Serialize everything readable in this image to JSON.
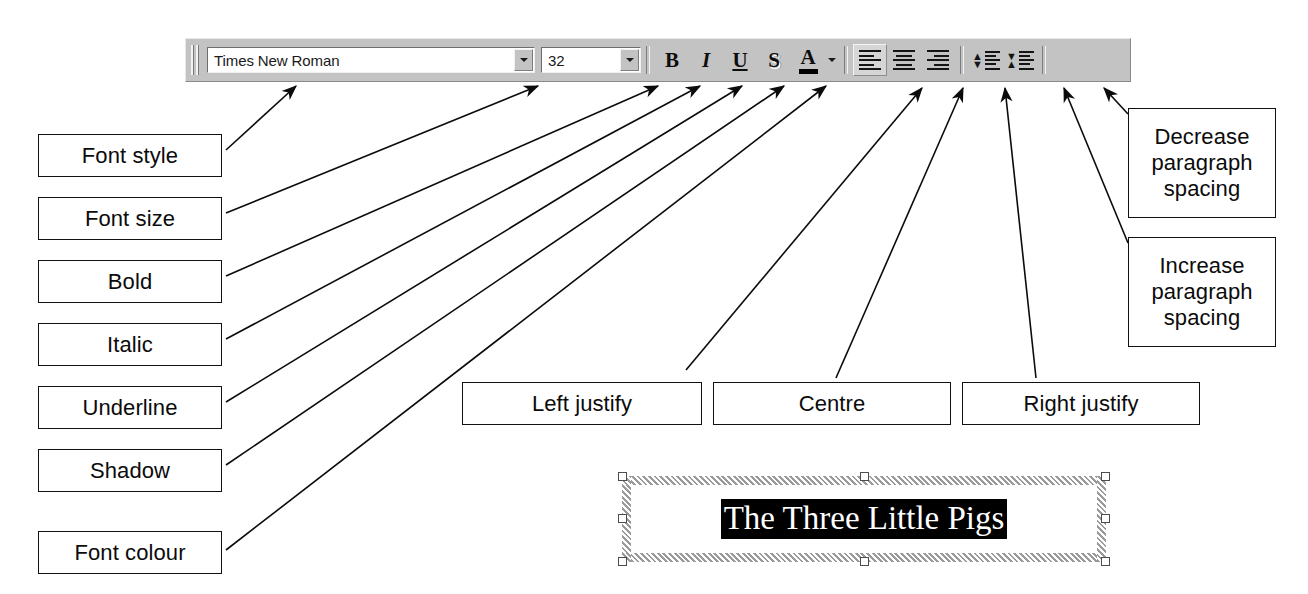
{
  "toolbar": {
    "name": "Formatting toolbar",
    "grip": "drag-grip",
    "font_family": {
      "value": "Times New Roman",
      "placeholder": "Font",
      "dropdown": "chevron-down-icon"
    },
    "font_size": {
      "value": "32",
      "placeholder": "Size",
      "dropdown": "chevron-down-icon"
    },
    "buttons": [
      {
        "name": "bold",
        "glyph": "B"
      },
      {
        "name": "italic",
        "glyph": "I"
      },
      {
        "name": "underline",
        "glyph": "U"
      },
      {
        "name": "shadow",
        "glyph": "S"
      },
      {
        "name": "font-colour",
        "glyph": "A"
      }
    ],
    "font_colour_caret": "chevron-down-icon",
    "align_buttons": [
      {
        "name": "align-left",
        "state": "pressed"
      },
      {
        "name": "align-centre",
        "state": "normal"
      },
      {
        "name": "align-right",
        "state": "normal"
      }
    ],
    "spacing_buttons": [
      {
        "name": "decrease-paragraph-spacing"
      },
      {
        "name": "increase-paragraph-spacing"
      }
    ]
  },
  "annotations": {
    "font_style": "Font style",
    "font_size": "Font size",
    "bold": "Bold",
    "italic": "Italic",
    "underline": "Underline",
    "shadow": "Shadow",
    "font_colour": "Font colour",
    "left_justify": "Left justify",
    "centre": "Centre",
    "right_justify": "Right justify",
    "decrease_spacing_line1": "Decrease",
    "decrease_spacing_line2": "paragraph",
    "decrease_spacing_line3": "spacing",
    "increase_spacing_line1": "Increase",
    "increase_spacing_line2": "paragraph",
    "increase_spacing_line3": "spacing"
  },
  "text_frame": {
    "name": "selected-text-box",
    "content": "The Three Little Pigs",
    "selection_background": "#000000",
    "selection_foreground": "#ffffff",
    "handles": 8
  },
  "colors": {
    "toolbar_face": "#c3c3c3",
    "outline": "#111111",
    "page_background": "#ffffff",
    "glyph": "#0d0d0d"
  }
}
